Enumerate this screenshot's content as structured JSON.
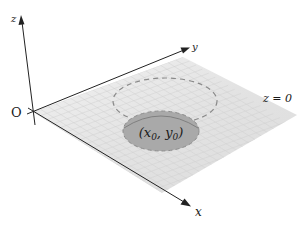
{
  "diagram": {
    "axes": {
      "z_label": "z",
      "y_label": "y",
      "x_label": "x",
      "origin_label": "O"
    },
    "plane": {
      "label": "z = 0",
      "fill": "#e6e6e6",
      "grid_color": "#d2d2d2"
    },
    "disk": {
      "label_x": "x",
      "label_y": "y",
      "label_sub": "0",
      "fill": "#a9a9a9",
      "edge": "#808080"
    },
    "dashed_circle": {
      "stroke": "#8a8a8a"
    },
    "colors": {
      "axis": "#222222",
      "background": "#ffffff"
    }
  }
}
